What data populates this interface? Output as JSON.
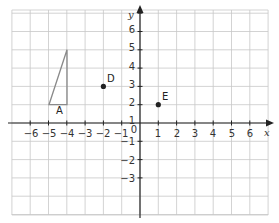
{
  "chart_data": {
    "type": "scatter",
    "title": "",
    "xlabel": "x",
    "ylabel": "y",
    "xlim": [
      -7,
      7
    ],
    "ylim": [
      -3.5,
      7
    ],
    "grid": true,
    "x_ticks": [
      "−6",
      "−5",
      "−4",
      "−3",
      "−2",
      "−1",
      "1",
      "2",
      "3",
      "4",
      "5",
      "6"
    ],
    "y_ticks": [
      "6",
      "5",
      "4",
      "3",
      "2",
      "1",
      "−1",
      "−2",
      "−3"
    ],
    "origin_label": "0",
    "points": [
      {
        "label": "D",
        "x": -2,
        "y": 2
      },
      {
        "label": "E",
        "x": 1,
        "y": 1
      }
    ],
    "shapes": [
      {
        "label": "A",
        "type": "triangle",
        "vertices": [
          [
            -5,
            1
          ],
          [
            -4,
            1
          ],
          [
            -4,
            4
          ]
        ]
      }
    ]
  },
  "labels": {
    "x_axis": "x",
    "y_axis": "y",
    "origin": "0",
    "point_d": "D",
    "point_e": "E",
    "shape_a": "A",
    "xt": [
      "−6",
      "−5",
      "−4",
      "−3",
      "−2",
      "−1",
      "1",
      "2",
      "3",
      "4",
      "5",
      "6"
    ],
    "yt": [
      "6",
      "5",
      "4",
      "3",
      "2",
      "1",
      "−1",
      "−2",
      "−3"
    ]
  },
  "colors": {
    "grid": "#c8c8c8",
    "axis": "#222222",
    "shape": "#8a8a8a",
    "point": "#222222"
  }
}
